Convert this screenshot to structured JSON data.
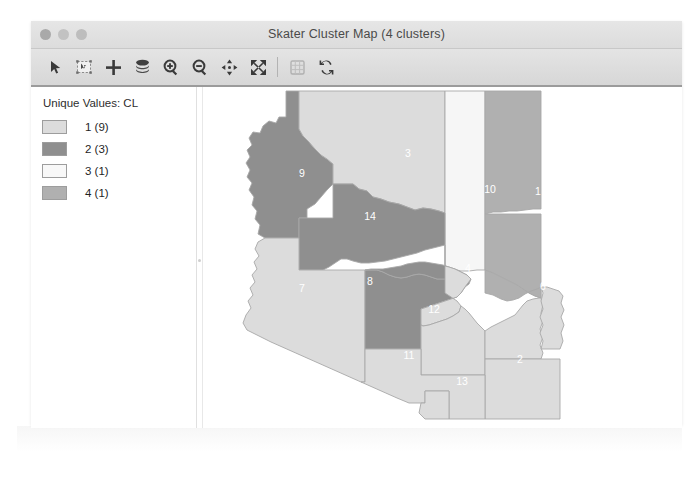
{
  "window": {
    "title": "Skater Cluster Map (4 clusters)",
    "traffic_lights": [
      "close-button",
      "minimize-button",
      "maximize-button"
    ]
  },
  "toolbar": {
    "buttons": [
      {
        "name": "select-pointer-tool",
        "icon": "arrow-pointer-icon",
        "label": "Select",
        "enabled": true
      },
      {
        "name": "select-rectangle-tool",
        "icon": "selection-rect-icon",
        "label": "Rectangle Select",
        "enabled": true
      },
      {
        "name": "crosshair-tool",
        "icon": "crosshair-plus-icon",
        "label": "Crosshair",
        "enabled": true
      },
      {
        "name": "layers-tool",
        "icon": "layers-stack-icon",
        "label": "Layers",
        "enabled": true
      },
      {
        "name": "zoom-in-tool",
        "icon": "zoom-in-icon",
        "label": "Zoom In",
        "enabled": true
      },
      {
        "name": "zoom-out-tool",
        "icon": "zoom-out-icon",
        "label": "Zoom Out",
        "enabled": true
      },
      {
        "name": "pan-tool",
        "icon": "pan-four-arrows-icon",
        "label": "Pan",
        "enabled": true
      },
      {
        "name": "full-extent-tool",
        "icon": "expand-arrows-icon",
        "label": "Full Extent",
        "enabled": true
      },
      {
        "name": "table-tool",
        "icon": "table-grid-icon",
        "label": "Table",
        "enabled": false
      },
      {
        "name": "refresh-tool",
        "icon": "refresh-arrows-icon",
        "label": "Refresh",
        "enabled": true
      }
    ]
  },
  "legend": {
    "title": "Unique Values: CL",
    "items": [
      {
        "label": "1 (9)",
        "value": 1,
        "count": 9,
        "color": "#dcdcdc"
      },
      {
        "label": "2 (3)",
        "value": 2,
        "count": 3,
        "color": "#8f8f8f"
      },
      {
        "label": "3 (1)",
        "value": 3,
        "count": 1,
        "color": "#f6f6f6"
      },
      {
        "label": "4 (1)",
        "value": 4,
        "count": 1,
        "color": "#b0b0b0"
      }
    ]
  },
  "map": {
    "regions": [
      {
        "id": "region-1",
        "label": "1",
        "cluster": 4,
        "color": "#b0b0b0",
        "label_x": 566,
        "label_y": 214
      },
      {
        "id": "region-2",
        "label": "2",
        "cluster": 1,
        "color": "#dcdcdc",
        "label_x": 548,
        "label_y": 382
      },
      {
        "id": "region-3",
        "label": "3",
        "cluster": 1,
        "color": "#dcdcdc",
        "label_x": 436,
        "label_y": 176
      },
      {
        "id": "region-4",
        "label": "4",
        "cluster": 1,
        "color": "#dcdcdc",
        "label_x": 496,
        "label_y": 291
      },
      {
        "id": "region-5",
        "label": "5",
        "cluster": 1,
        "color": "#dcdcdc",
        "label_x": 537,
        "label_y": 330
      },
      {
        "id": "region-6",
        "label": "6",
        "cluster": 1,
        "color": "#dcdcdc",
        "label_x": 571,
        "label_y": 309
      },
      {
        "id": "region-7",
        "label": "7",
        "cluster": 1,
        "color": "#dcdcdc",
        "label_x": 330,
        "label_y": 311
      },
      {
        "id": "region-8",
        "label": "8",
        "cluster": 2,
        "color": "#8f8f8f",
        "label_x": 398,
        "label_y": 304
      },
      {
        "id": "region-9",
        "label": "9",
        "cluster": 2,
        "color": "#8f8f8f",
        "label_x": 330,
        "label_y": 196
      },
      {
        "id": "region-10",
        "label": "10",
        "cluster": 3,
        "color": "#f6f6f6",
        "label_x": 518,
        "label_y": 212
      },
      {
        "id": "region-11",
        "label": "11",
        "cluster": 1,
        "color": "#dcdcdc",
        "label_x": 437,
        "label_y": 378
      },
      {
        "id": "region-12",
        "label": "12",
        "cluster": 1,
        "color": "#dcdcdc",
        "label_x": 462,
        "label_y": 332
      },
      {
        "id": "region-13",
        "label": "13",
        "cluster": 1,
        "color": "#dcdcdc",
        "label_x": 490,
        "label_y": 404
      },
      {
        "id": "region-14",
        "label": "14",
        "cluster": 2,
        "color": "#8f8f8f",
        "label_x": 398,
        "label_y": 239
      }
    ]
  }
}
